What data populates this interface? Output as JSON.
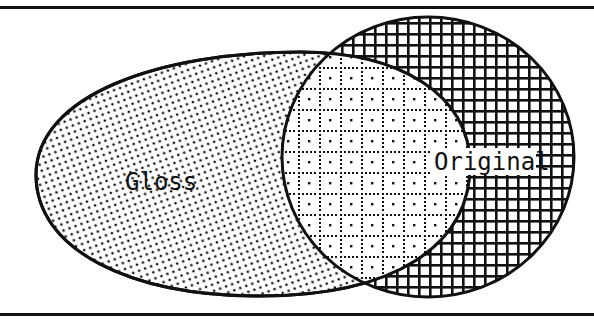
{
  "diagram": {
    "type": "venn",
    "sets": [
      {
        "name": "gloss",
        "label": "Gloss",
        "fill_pattern": "fine-dots"
      },
      {
        "name": "original",
        "label": "Original",
        "fill_pattern": "crosshatch"
      }
    ],
    "intersection": {
      "fill_pattern": "dotted-grid-with-center-dots"
    },
    "colors": {
      "ink": "#111111",
      "background": "#ffffff"
    },
    "frame": {
      "top_rule": true,
      "bottom_rule": true
    }
  }
}
